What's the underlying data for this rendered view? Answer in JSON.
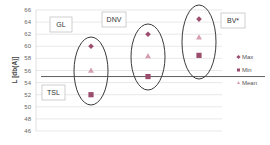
{
  "chart_data": {
    "type": "scatter",
    "title": "",
    "xlabel": "",
    "ylabel": "L [db(A)]",
    "ylim": [
      46,
      66
    ],
    "yticks": [
      46,
      48,
      50,
      52,
      54,
      56,
      58,
      60,
      62,
      64,
      66
    ],
    "grid": true,
    "legend_position": "right",
    "categories": [
      "GL",
      "DNV",
      "BV*"
    ],
    "series": [
      {
        "name": "Max",
        "marker": "diamond",
        "color": "#9b4d6e",
        "values": [
          60,
          62,
          64.5
        ]
      },
      {
        "name": "Min",
        "marker": "square",
        "color": "#9b4d6e",
        "values": [
          52,
          55,
          58.5
        ]
      },
      {
        "name": "Mean",
        "marker": "triangle",
        "color": "#d4a0b0",
        "values": [
          56,
          58.4,
          61.5
        ]
      }
    ],
    "reference_line": {
      "label": "TSL",
      "value": 55
    },
    "annotations": [
      "GL",
      "DNV",
      "BV*",
      "TSL"
    ]
  },
  "labels": {
    "gl": "GL",
    "dnv": "DNV",
    "bv": "BV*",
    "tsl": "TSL",
    "ylabel": "L [db(A)]",
    "legend_max": "Max",
    "legend_min": "Min",
    "legend_mean": "Mean"
  },
  "colors": {
    "marker_dark": "#9b4d6e",
    "marker_light": "#d4a0b0",
    "grid": "#d9d9d9",
    "ellipse": "#3a3a3a"
  }
}
